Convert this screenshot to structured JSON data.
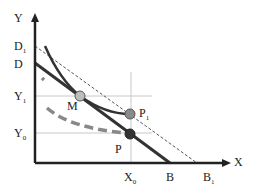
{
  "diagram": {
    "axes": {
      "y_label": "Y",
      "x_label": "X"
    },
    "y_ticks": [
      {
        "label": "D",
        "sub": "1"
      },
      {
        "label": "D",
        "sub": ""
      },
      {
        "label": "Y",
        "sub": "1"
      },
      {
        "label": "Y",
        "sub": "0"
      }
    ],
    "x_ticks": [
      {
        "label": "X",
        "sub": "0"
      },
      {
        "label": "B",
        "sub": ""
      },
      {
        "label": "B",
        "sub": "1"
      }
    ],
    "points": [
      {
        "label": "M",
        "sub": ""
      },
      {
        "label": "P",
        "sub": "1"
      },
      {
        "label": "P",
        "sub": ""
      }
    ],
    "colors": {
      "axis": "#222222",
      "budget": "#333333",
      "dashed_curve": "#888888",
      "guide": "#bbbbbb",
      "point_m": "#bdbdbd",
      "point_p1": "#8a8a8a",
      "point_p": "#333333"
    }
  }
}
